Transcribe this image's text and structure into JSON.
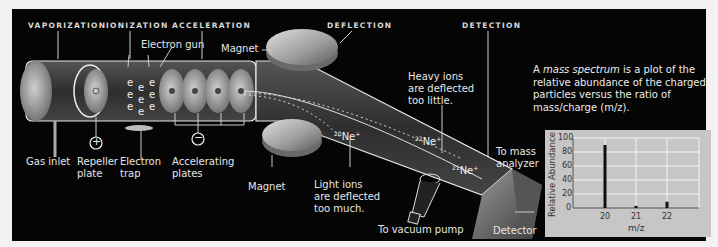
{
  "stages": {
    "vaporization": "VAPORIZATION",
    "ionization": "IONIZATION",
    "acceleration": "ACCELERATION",
    "deflection": "DEFLECTION",
    "detection": "DETECTION"
  },
  "labels": {
    "electron_gun": "Electron gun",
    "magnet_top": "Magnet",
    "magnet_bottom": "Magnet",
    "gas_inlet": "Gas inlet",
    "repeller_plate_1": "Repeller",
    "repeller_plate_2": "plate",
    "electron_trap_1": "Electron",
    "electron_trap_2": "trap",
    "accelerating_plates_1": "Accelerating",
    "accelerating_plates_2": "plates",
    "heavy_ions_1": "Heavy ions",
    "heavy_ions_2": "are deflected",
    "heavy_ions_3": "too little.",
    "light_ions_1": "Light ions",
    "light_ions_2": "are deflected",
    "light_ions_3": "too much.",
    "to_mass_analyzer_1": "To mass",
    "to_mass_analyzer_2": "analyzer",
    "to_vacuum_pump": "To vacuum pump",
    "detector": "Detector",
    "plus_sign": "+",
    "minus_sign": "−",
    "electron_symbol": "e"
  },
  "ions": {
    "ne20": {
      "mass": "20",
      "symbol": "Ne",
      "charge": "+"
    },
    "ne21": {
      "mass": "21",
      "symbol": "Ne",
      "charge": "+"
    },
    "ne22": {
      "mass": "22",
      "symbol": "Ne",
      "charge": "+"
    }
  },
  "description": {
    "prefix": "A ",
    "emphasis": "mass spectrum",
    "rest": " is a plot of the relative abundance of the charged particles versus the ratio of mass/charge (m/z)."
  },
  "chart_data": {
    "type": "bar",
    "title": "",
    "categories": [
      "20",
      "21",
      "22"
    ],
    "values": [
      90,
      3,
      9
    ],
    "xlabel": "m/z",
    "ylabel": "Relative Abundance",
    "ylim": [
      0,
      100
    ],
    "yticks": [
      "0",
      "20",
      "40",
      "60",
      "80",
      "100"
    ],
    "xticks": [
      "20",
      "21",
      "22"
    ],
    "grid": true,
    "legend": null
  },
  "colors": {
    "background": "#050505",
    "chart_bg": "#c6c6c6",
    "text": "#e6e6e6",
    "tube": "#3a3a3a"
  }
}
